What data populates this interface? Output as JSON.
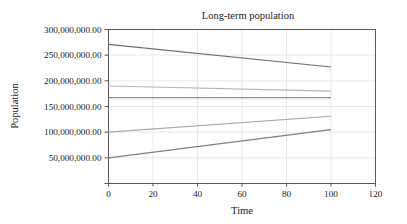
{
  "chart_data": {
    "type": "line",
    "title": "Long-term population",
    "xlabel": "Time",
    "ylabel": "Population",
    "xlim": [
      0,
      120
    ],
    "ylim": [
      0,
      300000000
    ],
    "grid": true,
    "legend": "none",
    "x_ticks": [
      0,
      20,
      40,
      60,
      80,
      100,
      120
    ],
    "x_tick_labels": [
      "0",
      "20",
      "40",
      "60",
      "80",
      "100",
      "120"
    ],
    "y_ticks": [
      50000000,
      100000000,
      150000000,
      200000000,
      250000000,
      300000000
    ],
    "y_tick_labels": [
      "50,000,000.00",
      "100,000,000.00",
      "150,000,000.00",
      "200,000,000.00",
      "250,000,000.00",
      "300,000,000.00"
    ],
    "x": [
      0,
      100
    ],
    "series": [
      {
        "name": "series-1",
        "values": [
          271000000,
          227000000
        ],
        "color": "#6e6e6e"
      },
      {
        "name": "series-2",
        "values": [
          190000000,
          180000000
        ],
        "color": "#b5b5b5"
      },
      {
        "name": "series-3",
        "values": [
          167000000,
          167000000
        ],
        "color": "#737373"
      },
      {
        "name": "series-4",
        "values": [
          100000000,
          131000000
        ],
        "color": "#a8a8a8"
      },
      {
        "name": "series-5",
        "values": [
          50000000,
          105000000
        ],
        "color": "#808080"
      }
    ]
  },
  "figure": {
    "frame_color": "#595959",
    "grid_color": "#e8e8e8",
    "background": "#ffffff"
  }
}
